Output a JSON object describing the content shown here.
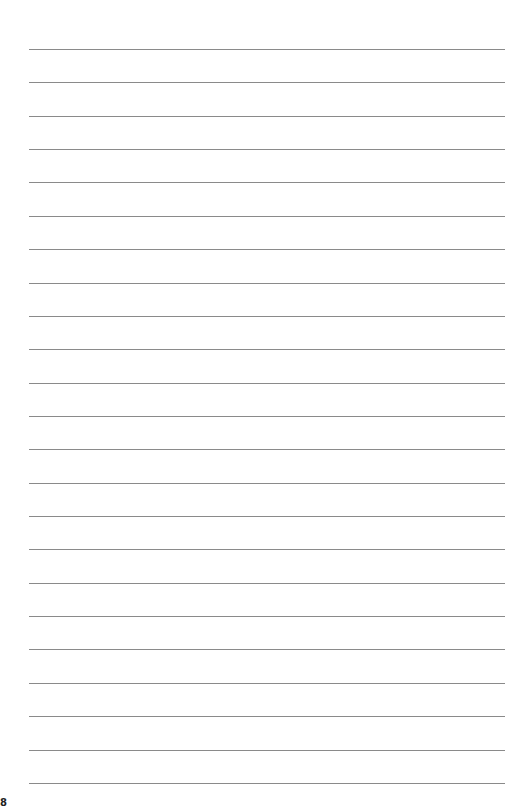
{
  "page": {
    "type": "lined-paper",
    "line_count": 23,
    "first_line_y": 49,
    "line_spacing": 33.36,
    "line_color": "#8a8a8a",
    "page_number_fragment": "8"
  }
}
